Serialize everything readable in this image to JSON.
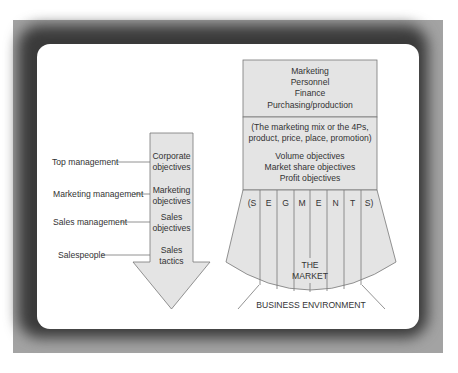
{
  "colors": {
    "frame": "#a3a3a3",
    "panel": "#ffffff",
    "shape_fill": "#e4e4e4",
    "stroke": "#777777",
    "text": "#333333"
  },
  "left_levels": [
    {
      "role": "Top management",
      "objective": [
        "Corporate",
        "objectives"
      ]
    },
    {
      "role": "Marketing management",
      "objective": [
        "Marketing",
        "objectives"
      ]
    },
    {
      "role": "Sales management",
      "objective": [
        "Sales",
        "objectives"
      ]
    },
    {
      "role": "Salespeople",
      "objective": [
        "Sales",
        "tactics"
      ]
    }
  ],
  "right_stack": {
    "functions": [
      "Marketing",
      "Personnel",
      "Finance",
      "Purchasing/production"
    ],
    "mix": [
      "(The marketing mix or the 4Ps,",
      "product, price, place, promotion)"
    ],
    "objectives": [
      "Volume objectives",
      "Market share objectives",
      "Profit objectives"
    ],
    "segments": [
      "(S",
      "E",
      "G",
      "M",
      "E",
      "N",
      "T",
      "S)"
    ],
    "market": [
      "THE",
      "MARKET"
    ],
    "environment": "BUSINESS ENVIRONMENT"
  }
}
